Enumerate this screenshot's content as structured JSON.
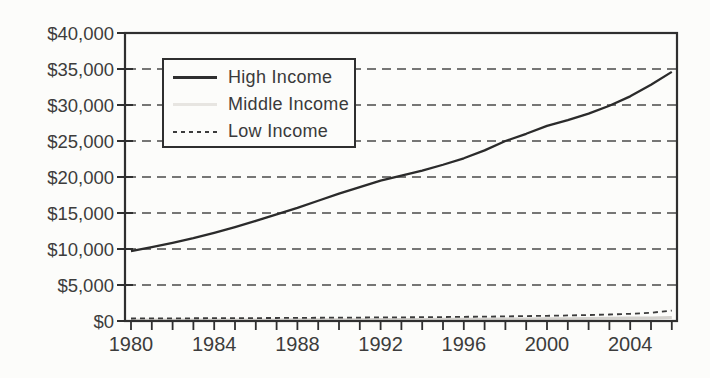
{
  "figure": {
    "background": "#fcfcfa",
    "ink": "#2f2f2f",
    "label_color": "#3c3c3c",
    "gridline_color": "#4a4a4a"
  },
  "chart_data": {
    "type": "line",
    "title": "",
    "xlabel": "",
    "ylabel": "",
    "x": [
      1980,
      1981,
      1982,
      1983,
      1984,
      1985,
      1986,
      1987,
      1988,
      1989,
      1990,
      1991,
      1992,
      1993,
      1994,
      1995,
      1996,
      1997,
      1998,
      1999,
      2000,
      2001,
      2002,
      2003,
      2004,
      2005,
      2006
    ],
    "x_tick_labels": [
      "1980",
      "1984",
      "1988",
      "1992",
      "1996",
      "2000",
      "2004"
    ],
    "x_ticks_labeled": [
      1980,
      1984,
      1988,
      1992,
      1996,
      2000,
      2004
    ],
    "x_minor_tick_every": 1,
    "xlim": [
      1980,
      2006
    ],
    "y_ticks": [
      0,
      5000,
      10000,
      15000,
      20000,
      25000,
      30000,
      35000,
      40000
    ],
    "y_tick_labels": [
      "$0",
      "$5,000",
      "$10,000",
      "$15,000",
      "$20,000",
      "$25,000",
      "$30,000",
      "$35,000",
      "$40,000"
    ],
    "ylim": [
      0,
      40000
    ],
    "grid": "horizontal dashed gridlines at each $5,000 level",
    "legend_position": "upper-left inside plot, boxed",
    "series": [
      {
        "name": "Middle Income",
        "style": "solid",
        "color": "#d3d1cd",
        "width": 3,
        "values": [
          120,
          125,
          130,
          135,
          140,
          145,
          150,
          155,
          165,
          170,
          180,
          190,
          200,
          210,
          220,
          230,
          240,
          255,
          270,
          285,
          300,
          320,
          345,
          370,
          400,
          430,
          470
        ]
      },
      {
        "name": "Low Income",
        "style": "dashed",
        "color": "#3c3c3c",
        "width": 1.8,
        "values": [
          350,
          360,
          370,
          380,
          390,
          400,
          410,
          420,
          440,
          450,
          470,
          480,
          500,
          510,
          530,
          550,
          580,
          610,
          640,
          680,
          720,
          770,
          830,
          900,
          1000,
          1150,
          1450
        ]
      },
      {
        "name": "High Income",
        "style": "solid",
        "color": "#2b2b2b",
        "width": 2.3,
        "values": [
          9700,
          10250,
          10850,
          11500,
          12250,
          13050,
          13900,
          14800,
          15700,
          16700,
          17700,
          18600,
          19500,
          20200,
          20900,
          21700,
          22600,
          23700,
          25000,
          26000,
          27100,
          27900,
          28800,
          29900,
          31200,
          32800,
          34600
        ]
      }
    ],
    "legend_order": [
      "High Income",
      "Middle Income",
      "Low Income"
    ]
  },
  "legend": {
    "items": [
      {
        "label": "High Income",
        "sample": "solid-dark-line"
      },
      {
        "label": "Middle Income",
        "sample": "solid-light-gray-line"
      },
      {
        "label": "Low Income",
        "sample": "fine-dashed-line"
      }
    ]
  }
}
